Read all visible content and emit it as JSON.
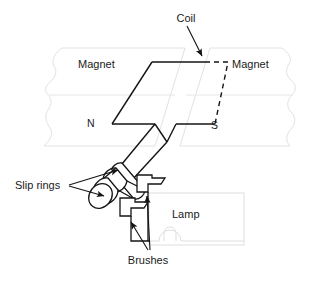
{
  "figure": {
    "background_color": "#ffffff",
    "ink_color": "#141414",
    "faint_color": "#e2e2e4"
  },
  "labels": {
    "coil": "Coil",
    "magnet_left": "Magnet",
    "magnet_right": "Magnet",
    "pole_north": "N",
    "pole_south": "S",
    "slip_rings": "Slip rings",
    "brushes": "Brushes",
    "lamp": "Lamp"
  },
  "parts": [
    {
      "name": "coil",
      "label": "Coil",
      "style": "solid outline with dashed hidden edges"
    },
    {
      "name": "magnet-left",
      "label": "Magnet",
      "pole": "N",
      "style": "faint grey torn-edge block"
    },
    {
      "name": "magnet-right",
      "label": "Magnet",
      "pole": "S",
      "style": "faint grey torn-edge block"
    },
    {
      "name": "slip-rings",
      "label": "Slip rings",
      "count": 2,
      "style": "cylinders on shaft"
    },
    {
      "name": "brushes",
      "label": "Brushes",
      "count": 2,
      "style": "bent contact strips"
    },
    {
      "name": "lamp",
      "label": "Lamp",
      "style": "faint grey rectangle with bulb symbol"
    }
  ],
  "annotations": [
    {
      "name": "coil-leader",
      "text": "Coil",
      "points_to": "coil-top-edge",
      "arrow": true
    },
    {
      "name": "slip-rings-leader",
      "text": "Slip rings",
      "points_to": "slip-ring-cylinders",
      "arrow": true,
      "arrow_count": 2
    },
    {
      "name": "brushes-leader",
      "text": "Brushes",
      "points_to": "brush-contacts",
      "arrow": true,
      "arrow_count": 2
    }
  ]
}
